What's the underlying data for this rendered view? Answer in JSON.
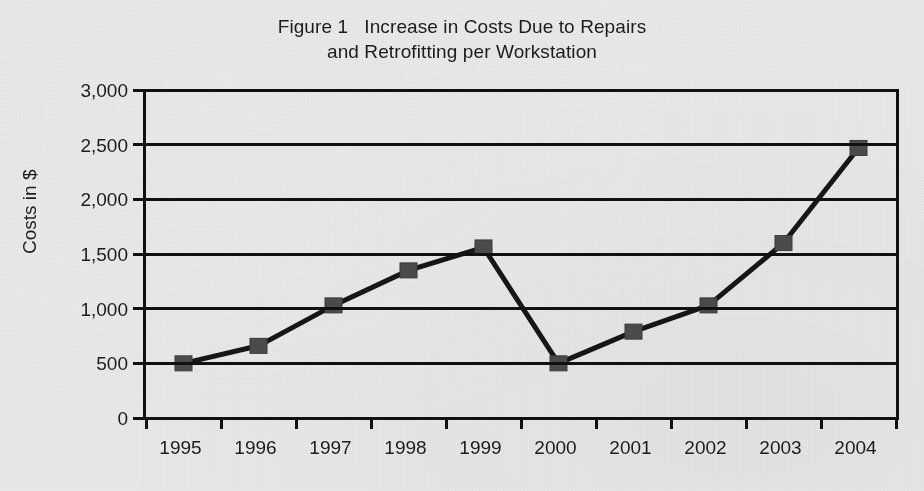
{
  "chart_data": {
    "type": "line",
    "title": "Figure 1   Increase in Costs Due to Repairs\nand Retrofitting per Workstation",
    "title_lines": [
      "Figure 1   Increase in Costs Due to Repairs",
      "and Retrofitting per Workstation"
    ],
    "xlabel": "",
    "ylabel": "Costs in $",
    "categories": [
      "1995",
      "1996",
      "1997",
      "1998",
      "1999",
      "2000",
      "2001",
      "2002",
      "2003",
      "2004"
    ],
    "values": [
      500,
      660,
      1030,
      1350,
      1560,
      500,
      790,
      1030,
      1600,
      2470
    ],
    "series": [
      {
        "name": "Costs per workstation",
        "values": [
          500,
          660,
          1030,
          1350,
          1560,
          500,
          790,
          1030,
          1600,
          2470
        ]
      }
    ],
    "ylim": [
      0,
      3000
    ],
    "ytick_step": 500,
    "ytick_labels": [
      "3,000",
      "2,500",
      "2,000",
      "1,500",
      "1,000",
      "500",
      "0"
    ],
    "ytick_values": [
      3000,
      2500,
      2000,
      1500,
      1000,
      500,
      0
    ],
    "grid": true,
    "grid_axis": "y",
    "legend": false,
    "legend_position": "none",
    "marker": "square",
    "line_color": "#161616",
    "marker_color": "#4b4b4b",
    "background_color": "#e9e9e9"
  }
}
